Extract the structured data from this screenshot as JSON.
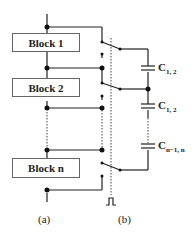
{
  "diagram": {
    "blocks": [
      {
        "label": "Block 1"
      },
      {
        "label": "Block 2"
      },
      {
        "label": "Block n"
      }
    ],
    "capacitors": [
      {
        "main": "C",
        "sub": "1, 2"
      },
      {
        "main": "C",
        "sub": "1, 2"
      },
      {
        "main": "C",
        "sub": "n−1, n"
      }
    ],
    "captions": {
      "a": "(a)",
      "b": "(b)"
    },
    "pulse_icon": "clock-pulse-icon"
  }
}
